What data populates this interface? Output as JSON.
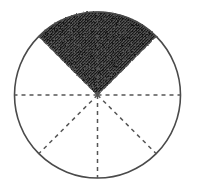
{
  "figure": {
    "caption": "",
    "background_color": "#ffffff",
    "canvas": {
      "width": 197,
      "height": 192
    }
  },
  "chart_data": {
    "type": "pie",
    "title": "",
    "subtitle": "",
    "xlabel": "",
    "ylabel": "",
    "grid": false,
    "legend_position": "none",
    "annotations": [],
    "geometry": {
      "center_x": 97.5,
      "center_y": 95,
      "radius": 83,
      "total_sectors": 8,
      "sector_angle_degrees": 45,
      "shaded_sectors": 2,
      "shaded_span_degrees": 90,
      "shaded_start_angle_degrees": 45,
      "shaded_end_angle_degrees": 135,
      "shaded_fraction": "2/8",
      "shaded_fraction_decimal": 0.25,
      "outline_style": "solid",
      "radii_style": "dashed",
      "dash_length": 4,
      "dash_gap": 4
    },
    "categories": [
      "sector-1",
      "sector-2",
      "sector-3",
      "sector-4",
      "sector-5",
      "sector-6",
      "sector-7",
      "sector-8"
    ],
    "values": [
      45,
      45,
      45,
      45,
      45,
      45,
      45,
      45
    ],
    "shaded_flags": [
      false,
      true,
      true,
      false,
      false,
      false,
      false,
      false
    ],
    "sectors": [
      {
        "name": "sector-1",
        "start_deg": 0,
        "end_deg": 45,
        "shaded": false
      },
      {
        "name": "sector-2",
        "start_deg": 45,
        "end_deg": 90,
        "shaded": true
      },
      {
        "name": "sector-3",
        "start_deg": 90,
        "end_deg": 135,
        "shaded": true
      },
      {
        "name": "sector-4",
        "start_deg": 135,
        "end_deg": 180,
        "shaded": false
      },
      {
        "name": "sector-5",
        "start_deg": 180,
        "end_deg": 225,
        "shaded": false
      },
      {
        "name": "sector-6",
        "start_deg": 225,
        "end_deg": 270,
        "shaded": false
      },
      {
        "name": "sector-7",
        "start_deg": 270,
        "end_deg": 315,
        "shaded": false
      },
      {
        "name": "sector-8",
        "start_deg": 315,
        "end_deg": 360,
        "shaded": false
      }
    ],
    "radii_lines": [
      {
        "name": "radius-right",
        "angle_deg": 0
      },
      {
        "name": "radius-up-right",
        "angle_deg": 45
      },
      {
        "name": "radius-up",
        "angle_deg": 90
      },
      {
        "name": "radius-up-left",
        "angle_deg": 135
      },
      {
        "name": "radius-left",
        "angle_deg": 180
      },
      {
        "name": "radius-down-left",
        "angle_deg": 225
      },
      {
        "name": "radius-down",
        "angle_deg": 270
      },
      {
        "name": "radius-down-right",
        "angle_deg": 315
      }
    ],
    "colors": {
      "shade_fill": "#3a3a3a",
      "shade_speckle": "#111111",
      "outline": "#4a4a4a",
      "dash_line": "#555555",
      "background": "#ffffff"
    }
  }
}
